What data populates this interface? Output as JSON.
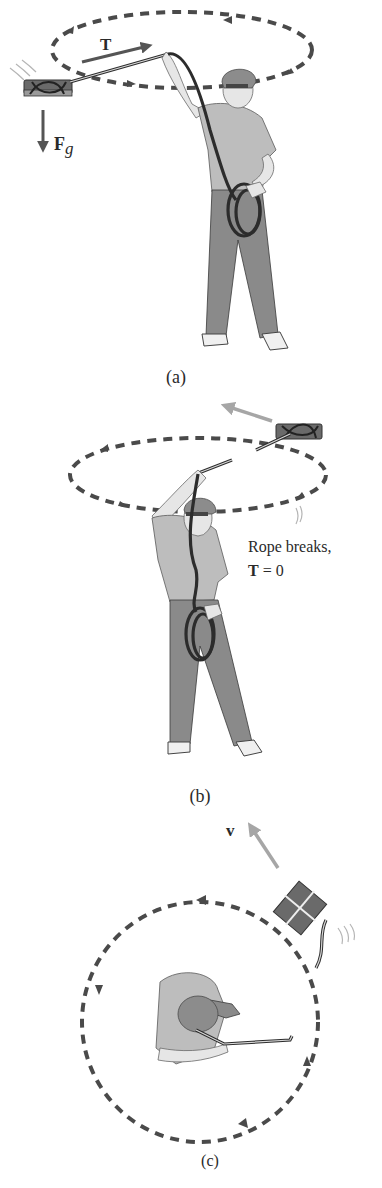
{
  "figure": {
    "panels": [
      {
        "id": "a",
        "caption": "(a)",
        "vectors": [
          {
            "symbol": "T",
            "subscript": "",
            "meaning": "tension",
            "style": "bold"
          },
          {
            "symbol": "F",
            "subscript": "g",
            "meaning": "gravitational force",
            "style": "bold"
          }
        ],
        "description": "Man whirling a box on a rope in a horizontal circle"
      },
      {
        "id": "b",
        "caption": "(b)",
        "annotation_line1": "Rope breaks,",
        "annotation_line2_symbol": "T",
        "annotation_line2_rest": " = 0",
        "description": "Rope breaks; box flies off tangentially"
      },
      {
        "id": "c",
        "caption": "(c)",
        "vectors": [
          {
            "symbol": "v",
            "meaning": "velocity",
            "style": "bold"
          }
        ],
        "description": "Top view: box leaves circular path along tangent"
      }
    ],
    "colors": {
      "path": "#4a4a4a",
      "vector_dark": "#555555",
      "vector_light": "#a6a6a6",
      "text": "#2a2a2a"
    }
  }
}
